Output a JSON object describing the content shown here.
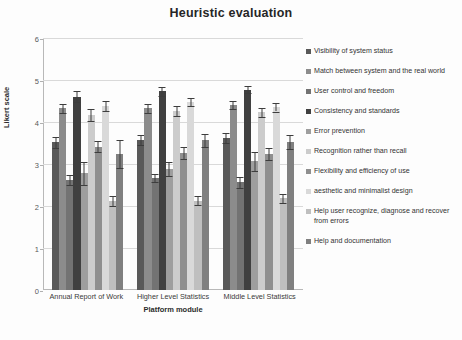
{
  "chart_data": {
    "type": "bar",
    "title": "Heuristic evaluation",
    "xlabel": "Platform module",
    "ylabel": "Likert scale",
    "ylim": [
      0,
      6
    ],
    "yticks": [
      0,
      1,
      2,
      3,
      4,
      5,
      6
    ],
    "grid": true,
    "legend_position": "right",
    "error_bars": true,
    "categories": [
      "Annual Report of Work",
      "Higher Level Statistics",
      "Middle Level Statistics"
    ],
    "series": [
      {
        "name": "Visibility of system status",
        "color": "#595959",
        "values": [
          3.52,
          3.58,
          3.62
        ],
        "errors": [
          0.13,
          0.12,
          0.12
        ]
      },
      {
        "name": "Match between system and the real world",
        "color": "#8c8c8c",
        "values": [
          4.33,
          4.33,
          4.4
        ],
        "errors": [
          0.11,
          0.11,
          0.1
        ]
      },
      {
        "name": "User control and freedom",
        "color": "#737373",
        "values": [
          2.62,
          2.67,
          2.56
        ],
        "errors": [
          0.12,
          0.1,
          0.13
        ]
      },
      {
        "name": "Consistency and standards",
        "color": "#404040",
        "values": [
          4.6,
          4.73,
          4.77
        ],
        "errors": [
          0.13,
          0.1,
          0.09
        ]
      },
      {
        "name": "Error prevention",
        "color": "#9e9e9e",
        "values": [
          2.78,
          2.88,
          3.06
        ],
        "errors": [
          0.27,
          0.17,
          0.22
        ]
      },
      {
        "name": "Recognition rather than recall",
        "color": "#cccccc",
        "values": [
          4.17,
          4.26,
          4.23
        ],
        "errors": [
          0.14,
          0.12,
          0.1
        ]
      },
      {
        "name": "Flexibility and efficiency of use",
        "color": "#8f8f8f",
        "values": [
          3.41,
          3.27,
          3.24
        ],
        "errors": [
          0.13,
          0.14,
          0.14
        ]
      },
      {
        "name": "aesthetic and minimalist design",
        "color": "#d9d9d9",
        "values": [
          4.38,
          4.48,
          4.35
        ],
        "errors": [
          0.12,
          0.09,
          0.1
        ]
      },
      {
        "name": "Help user recognize, diagnose and recover from errors",
        "color": "#bfbfbf",
        "values": [
          2.13,
          2.13,
          2.18
        ],
        "errors": [
          0.12,
          0.1,
          0.11
        ]
      },
      {
        "name": "Help and documentation",
        "color": "#808080",
        "values": [
          3.24,
          3.56,
          3.52
        ],
        "errors": [
          0.33,
          0.15,
          0.17
        ]
      }
    ]
  }
}
